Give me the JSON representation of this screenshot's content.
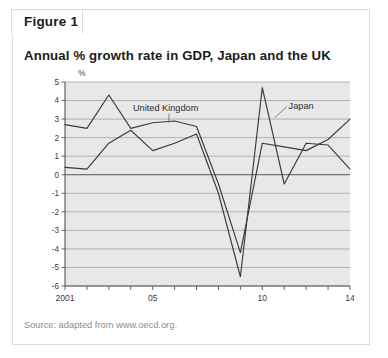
{
  "figure": {
    "tab_label": "Figure 1",
    "source": "Source: adapted from www.oecd.org."
  },
  "chart_data": {
    "type": "line",
    "title": "Annual % growth rate in GDP, Japan and the UK",
    "xlabel": "",
    "ylabel": "%",
    "yunit": "%",
    "x": [
      2001,
      2002,
      2003,
      2004,
      2005,
      2006,
      2007,
      2008,
      2009,
      2010,
      2011,
      2012,
      2013,
      2014
    ],
    "xtick_values": [
      2001,
      2002,
      2003,
      2004,
      2005,
      2006,
      2007,
      2008,
      2009,
      2010,
      2011,
      2012,
      2013,
      2014
    ],
    "xtick_labels": [
      "2001",
      "",
      "",
      "",
      "05",
      "",
      "",
      "",
      "",
      "10",
      "",
      "",
      "",
      "14"
    ],
    "ytick_labels": [
      "5",
      "4",
      "3",
      "2",
      "1",
      "0",
      "-1",
      "-2",
      "-3",
      "-4",
      "-5",
      "-6"
    ],
    "ytick_values": [
      5,
      4,
      3,
      2,
      1,
      0,
      -1,
      -2,
      -3,
      -4,
      -5,
      -6
    ],
    "ylim": [
      -6,
      5
    ],
    "xlim": [
      2001,
      2014
    ],
    "grid": true,
    "legend": "inline-annotations",
    "series": [
      {
        "name": "United Kingdom",
        "values": [
          2.7,
          2.5,
          4.3,
          2.5,
          2.8,
          2.9,
          2.6,
          -0.5,
          -4.2,
          1.7,
          1.5,
          1.3,
          1.9,
          3.0
        ]
      },
      {
        "name": "Japan",
        "values": [
          0.4,
          0.3,
          1.7,
          2.4,
          1.3,
          1.7,
          2.2,
          -1.0,
          -5.5,
          4.7,
          -0.5,
          1.7,
          1.6,
          0.3
        ]
      }
    ],
    "annotations": [
      {
        "text": "United Kingdom",
        "x": 2004.1,
        "y": 3.45
      },
      {
        "text": "Japan",
        "x": 2011.2,
        "y": 3.55
      }
    ],
    "colors": {
      "plot_background": "#e8e8e8",
      "series_line": "#3a3a3a",
      "gridline": "#9a9a9a",
      "axis": "#555555",
      "panel_border": "#dcdcdc",
      "title_text": "#1b1b1b",
      "source_text": "#8c8c8c"
    }
  }
}
